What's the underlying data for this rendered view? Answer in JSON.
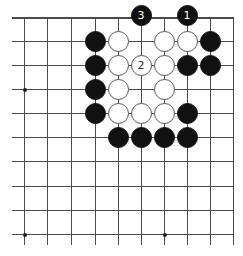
{
  "diagram": {
    "type": "go-board-fragment",
    "columns_x": [
      24,
      47,
      71,
      95,
      118,
      141,
      164,
      187,
      210,
      233
    ],
    "rows_y": [
      17,
      41,
      65,
      89,
      113,
      137,
      161,
      186,
      210,
      234
    ],
    "line_color": "#4a4a4a",
    "star_points": [
      {
        "col": 0,
        "row": 3
      },
      {
        "col": 0,
        "row": 9
      },
      {
        "col": 6,
        "row": 9
      }
    ],
    "stones": [
      {
        "color": "black",
        "col": 5,
        "row": 0,
        "label": "3"
      },
      {
        "color": "black",
        "col": 7,
        "row": 0,
        "label": "1"
      },
      {
        "color": "black",
        "col": 3,
        "row": 1,
        "label": ""
      },
      {
        "color": "white",
        "col": 4,
        "row": 1,
        "label": ""
      },
      {
        "color": "white",
        "col": 6,
        "row": 1,
        "label": ""
      },
      {
        "color": "white",
        "col": 7,
        "row": 1,
        "label": ""
      },
      {
        "color": "black",
        "col": 8,
        "row": 1,
        "label": ""
      },
      {
        "color": "black",
        "col": 3,
        "row": 2,
        "label": ""
      },
      {
        "color": "white",
        "col": 4,
        "row": 2,
        "label": ""
      },
      {
        "color": "white",
        "col": 5,
        "row": 2,
        "label": "2"
      },
      {
        "color": "white",
        "col": 6,
        "row": 2,
        "label": ""
      },
      {
        "color": "black",
        "col": 7,
        "row": 2,
        "label": ""
      },
      {
        "color": "black",
        "col": 8,
        "row": 2,
        "label": ""
      },
      {
        "color": "black",
        "col": 3,
        "row": 3,
        "label": ""
      },
      {
        "color": "white",
        "col": 4,
        "row": 3,
        "label": ""
      },
      {
        "color": "white",
        "col": 6,
        "row": 3,
        "label": ""
      },
      {
        "color": "black",
        "col": 3,
        "row": 4,
        "label": ""
      },
      {
        "color": "white",
        "col": 4,
        "row": 4,
        "label": ""
      },
      {
        "color": "white",
        "col": 5,
        "row": 4,
        "label": ""
      },
      {
        "color": "white",
        "col": 6,
        "row": 4,
        "label": ""
      },
      {
        "color": "black",
        "col": 7,
        "row": 4,
        "label": ""
      },
      {
        "color": "black",
        "col": 4,
        "row": 5,
        "label": ""
      },
      {
        "color": "black",
        "col": 5,
        "row": 5,
        "label": ""
      },
      {
        "color": "black",
        "col": 6,
        "row": 5,
        "label": ""
      },
      {
        "color": "black",
        "col": 7,
        "row": 5,
        "label": ""
      }
    ]
  }
}
